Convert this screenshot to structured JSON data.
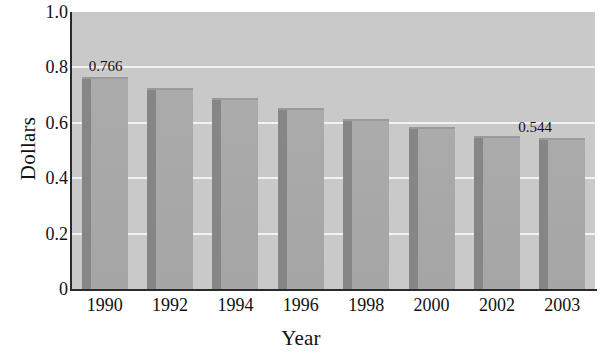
{
  "chart_data": {
    "type": "bar",
    "title": "",
    "xlabel": "Year",
    "ylabel": "Dollars",
    "categories": [
      "1990",
      "1992",
      "1994",
      "1996",
      "1998",
      "2000",
      "2002",
      "2003"
    ],
    "values": [
      0.766,
      0.726,
      0.69,
      0.653,
      0.614,
      0.585,
      0.552,
      0.544
    ],
    "point_labels": [
      "0.766",
      "",
      "",
      "",
      "",
      "",
      "",
      "0.544"
    ],
    "ylim": [
      0,
      1.0
    ],
    "ytick_labels": [
      "0",
      "0.2",
      "0.4",
      "0.6",
      "0.8",
      "1.0"
    ],
    "ytick_values": [
      0,
      0.2,
      0.4,
      0.6,
      0.8,
      1.0
    ],
    "grid": true,
    "gridline_color": "#f2f2f2",
    "legend": null,
    "legend_position": "none",
    "plot_background_color": "#c9c9c9",
    "bar_color": "#a8a8a8",
    "bar_side_color": "#868686",
    "axis_color": "#2a2a2a",
    "text_color": "#111111"
  }
}
